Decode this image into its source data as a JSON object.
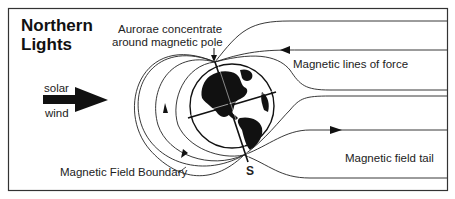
{
  "title": {
    "line1": "Northern",
    "line2": "Lights"
  },
  "labels": {
    "aurorae_line1": "Aurorae concentrate",
    "aurorae_line2": "around magnetic pole",
    "lines_of_force": "Magnetic lines of force",
    "solar": "solar",
    "wind": "wind",
    "field_boundary": "Magnetic Field Boundary",
    "field_tail": "Magnetic field tail",
    "south_pole": "S"
  },
  "icons": {
    "solar_wind_arrow": "arrow-right-icon",
    "earth": "globe-icon",
    "field_arrows": "triangle-arrow-icon"
  },
  "colors": {
    "ink": "#111111",
    "background": "#ffffff",
    "frame": "#333333"
  }
}
